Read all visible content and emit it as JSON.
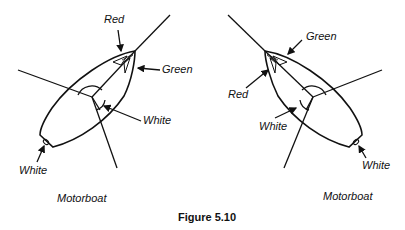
{
  "figure": {
    "caption": "Figure 5.10"
  },
  "left_boat": {
    "title": "Motorboat",
    "labels": {
      "red": "Red",
      "green": "Green",
      "masthead": "White",
      "stern": "White"
    }
  },
  "right_boat": {
    "title": "Motorboat",
    "labels": {
      "red": "Red",
      "green": "Green",
      "masthead": "White",
      "stern": "White"
    }
  },
  "colors": {
    "line": "#111111",
    "background": "#ffffff"
  }
}
